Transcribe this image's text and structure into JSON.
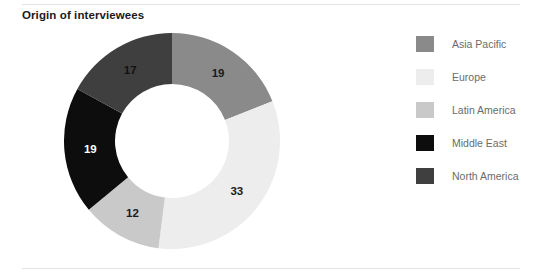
{
  "chart_title": "Origin of interviewees",
  "chart_data": {
    "type": "pie",
    "title": "Origin of interviewees",
    "subtitle": "",
    "xlabel": "",
    "ylabel": "",
    "donut": true,
    "grid": false,
    "legend_position": "right",
    "start_angle_deg": 0,
    "direction": "clockwise",
    "total": 100,
    "categories": [
      "Asia Pacific",
      "Europe",
      "Latin America",
      "Middle East",
      "North America"
    ],
    "values": [
      19,
      33,
      12,
      19,
      17
    ],
    "colors": [
      "#8a8a8a",
      "#ededed",
      "#c9c9c9",
      "#0d0d0d",
      "#3f3f3f"
    ],
    "label_colors": [
      "#1a1a1a",
      "#1a1a1a",
      "#1a1a1a",
      "#ffffff",
      "#111111"
    ],
    "slices": [
      {
        "label": "Asia Pacific",
        "value": 19,
        "value_text": "19",
        "color": "#8a8a8a",
        "label_color": "#1a1a1a"
      },
      {
        "label": "Europe",
        "value": 33,
        "value_text": "33",
        "color": "#ededed",
        "label_color": "#1a1a1a"
      },
      {
        "label": "Latin America",
        "value": 12,
        "value_text": "12",
        "color": "#c9c9c9",
        "label_color": "#1a1a1a"
      },
      {
        "label": "Middle East",
        "value": 19,
        "value_text": "19",
        "color": "#0d0d0d",
        "label_color": "#ffffff"
      },
      {
        "label": "North America",
        "value": 17,
        "value_text": "17",
        "color": "#3f3f3f",
        "label_color": "#111111"
      }
    ]
  },
  "legend": {
    "items": [
      {
        "label": "Asia Pacific",
        "color": "#8a8a8a"
      },
      {
        "label": "Europe",
        "color": "#ededed"
      },
      {
        "label": "Latin America",
        "color": "#c9c9c9"
      },
      {
        "label": "Middle East",
        "color": "#0d0d0d"
      },
      {
        "label": "North America",
        "color": "#3f3f3f"
      }
    ]
  },
  "geometry": {
    "center_x": 108,
    "center_y": 108,
    "outer_radius": 108,
    "inner_radius": 57,
    "label_radius": 82
  },
  "rules": {
    "top_visible": true,
    "bottom_visible": true,
    "color": "#e2e2e2"
  }
}
